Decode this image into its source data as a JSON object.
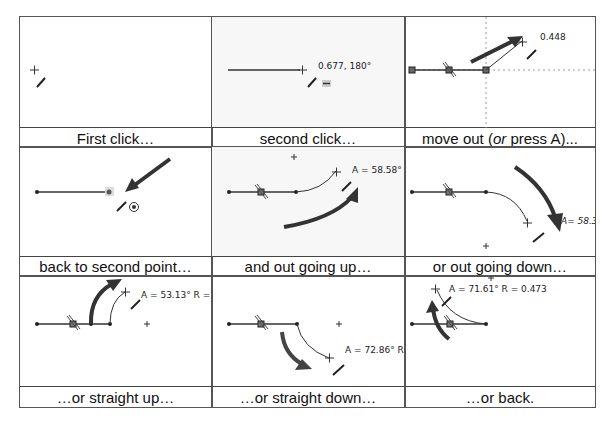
{
  "panels": [
    {
      "caption": "First click…"
    },
    {
      "caption": "second click…",
      "label": "0.677, 180°"
    },
    {
      "caption_pre": "move out (",
      "caption_em": "or",
      "caption_post": " press A)...",
      "label": "0.448"
    },
    {
      "caption": "back to second point…"
    },
    {
      "caption": "and out going up…",
      "label": "A = 58.58°"
    },
    {
      "caption": "or out going down…",
      "label": "A= 58.3'"
    },
    {
      "caption": "…or straight up…",
      "label": "A = 53.13° R ="
    },
    {
      "caption": "…or straight down…",
      "label": "A = 72.86° R"
    },
    {
      "caption": "…or back.",
      "label": "A = 71.61° R = 0.473"
    }
  ],
  "colors": {
    "line": "#333333",
    "arrow": "#3a3a3a",
    "grid": "#555555",
    "guide": "#888888"
  }
}
